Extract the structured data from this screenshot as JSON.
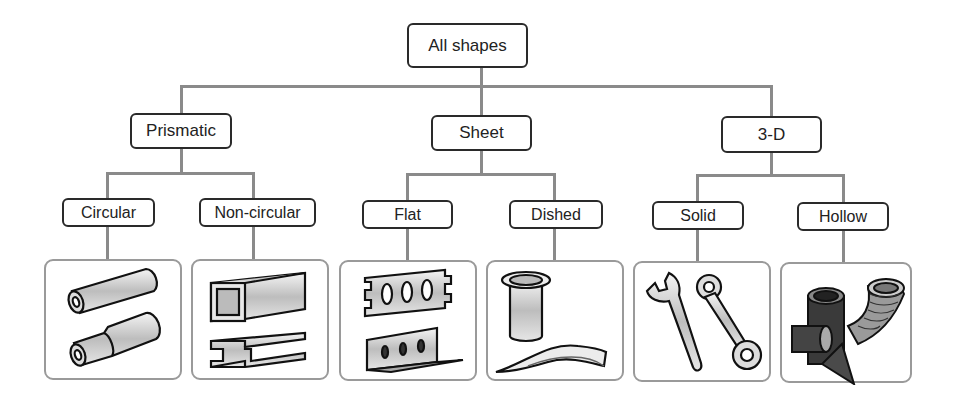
{
  "diagram": {
    "type": "tree",
    "root": {
      "label": "All shapes"
    },
    "categories": [
      {
        "label": "Prismatic",
        "children": [
          {
            "label": "Circular",
            "illustration": "round-tubes-icon"
          },
          {
            "label": "Non-circular",
            "illustration": "square-tube-and-i-beam-icon"
          }
        ]
      },
      {
        "label": "Sheet",
        "children": [
          {
            "label": "Flat",
            "illustration": "perforated-plate-and-angle-icon"
          },
          {
            "label": "Dished",
            "illustration": "cup-and-curved-sheet-icon"
          }
        ]
      },
      {
        "label": "3-D",
        "children": [
          {
            "label": "Solid",
            "illustration": "wrenches-icon"
          },
          {
            "label": "Hollow",
            "illustration": "corrugated-pipe-fittings-icon"
          }
        ]
      }
    ],
    "colors": {
      "connector": "#8a8a8a",
      "box_border": "#2a2a2a",
      "panel_border": "#9a9a9a",
      "text": "#222222"
    }
  }
}
